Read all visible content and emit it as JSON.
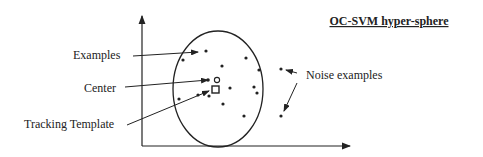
{
  "title": "OC-SVM hyper-sphere",
  "labels": {
    "examples": "Examples",
    "center": "Center",
    "tracking_template": "Tracking Template",
    "noise_examples": "Noise examples"
  },
  "colors": {
    "ink": "#222222",
    "background": "#ffffff"
  },
  "figure": {
    "axes": {
      "origin": [
        142,
        146
      ],
      "y_top": [
        142,
        14
      ],
      "x_right": [
        352,
        146
      ]
    },
    "sphere": {
      "cx": 218,
      "cy": 89,
      "rx": 45,
      "ry": 58
    },
    "center_marker": {
      "shape": "circle-outline",
      "x": 218,
      "y": 80
    },
    "template_marker": {
      "shape": "square-outline",
      "x": 216,
      "y": 90
    },
    "inlier_points": [
      [
        206,
        51
      ],
      [
        183,
        60
      ],
      [
        222,
        66
      ],
      [
        246,
        58
      ],
      [
        259,
        70
      ],
      [
        200,
        81
      ],
      [
        208,
        80
      ],
      [
        207,
        89
      ],
      [
        198,
        96
      ],
      [
        235,
        89
      ],
      [
        254,
        87
      ],
      [
        258,
        93
      ],
      [
        223,
        100
      ],
      [
        180,
        99
      ],
      [
        244,
        116
      ]
    ],
    "noise_points": [
      [
        282,
        68
      ],
      [
        281,
        116
      ]
    ]
  }
}
